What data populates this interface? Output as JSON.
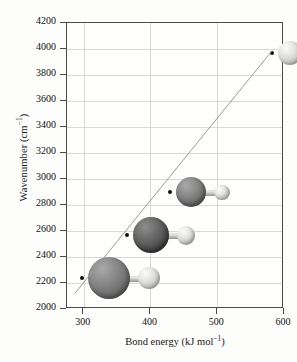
{
  "chart_data": {
    "type": "scatter",
    "title": "",
    "xlabel": "Bond energy (kJ mol−1)",
    "xlabel_base": "Bond energy (kJ mol",
    "xlabel_sup": "−1",
    "xlabel_tail": ")",
    "ylabel": "Wavenumber (cm−1)",
    "ylabel_base": "Wavenumber (cm",
    "ylabel_sup": "−1",
    "ylabel_tail": ")",
    "xlim": [
      275,
      600
    ],
    "ylim": [
      2000,
      4200
    ],
    "grid": true,
    "legend": "none",
    "xticks": [
      300,
      400,
      500,
      600
    ],
    "xtick_labels": [
      "300",
      "400",
      "500",
      "600"
    ],
    "yticks": [
      2000,
      2200,
      2400,
      2600,
      2800,
      3000,
      3200,
      3400,
      3600,
      3800,
      4000,
      4200
    ],
    "ytick_labels": [
      "2000",
      "2200",
      "2400",
      "2600",
      "2800",
      "3000",
      "3200",
      "3400",
      "3600",
      "3800",
      "4000",
      "4200"
    ],
    "points": [
      {
        "label": "HI",
        "x": 299,
        "y": 2230,
        "sphere_color": "#6d6d6d",
        "sphere_class": "sph-mid",
        "radius_px": 21
      },
      {
        "label": "HBr",
        "x": 366,
        "y": 2560,
        "sphere_color": "#3f3f3f",
        "sphere_class": "sph-dark",
        "radius_px": 18
      },
      {
        "label": "HCl",
        "x": 431,
        "y": 2890,
        "sphere_color": "#7d7d7d",
        "sphere_class": "sph-mid",
        "radius_px": 15
      },
      {
        "label": "HF",
        "x": 583,
        "y": 3960,
        "sphere_color": "#c8c8c4",
        "sphere_class": "sph-light",
        "radius_px": 12
      }
    ],
    "trendline": {
      "x0": 288,
      "y0": 2110,
      "x1": 583,
      "y1": 3975,
      "color": "#9a9a96"
    },
    "series": [
      {
        "name": "Hydrogen halides",
        "x": [
          299,
          366,
          431,
          583
        ],
        "y": [
          2230,
          2560,
          2890,
          3960
        ]
      }
    ],
    "annotations": [
      "Large sphere = halogen atom, small light sphere = hydrogen atom",
      "Sphere size decreases and lightness increases from HI to HF"
    ]
  },
  "colors": {
    "background": "#fdfdfb",
    "plot_background": "#fefefc",
    "axis": "#4a4a4a",
    "grid": "#d8d8d4",
    "text": "#111111",
    "trend": "#9a9a96",
    "marker": "#111111"
  }
}
